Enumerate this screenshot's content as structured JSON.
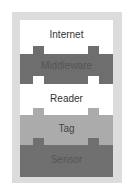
{
  "diagram": {
    "colors": {
      "frame": "#dcdcdc",
      "internet": "#ffffff",
      "middleware": "#6e6e6e",
      "reader": "#ffffff",
      "tag": "#ababab",
      "sensor": "#707070",
      "label_on_light": "#333333",
      "label_on_dark": "#555555"
    },
    "layers": [
      {
        "name": "Internet",
        "order": 1
      },
      {
        "name": "Middleware",
        "order": 2
      },
      {
        "name": "Reader",
        "order": 3
      },
      {
        "name": "Tag",
        "order": 4
      },
      {
        "name": "Sensor",
        "order": 5
      }
    ]
  }
}
